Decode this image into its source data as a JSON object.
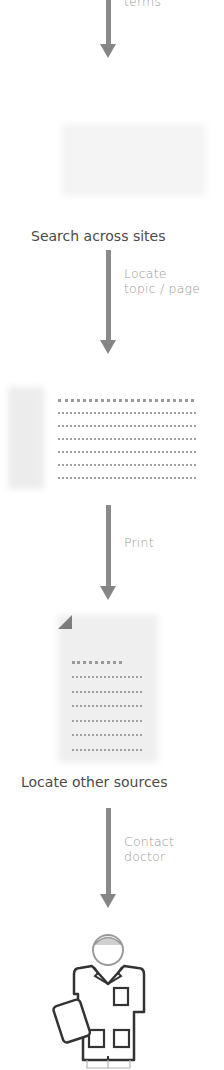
{
  "diagram": {
    "type": "vertical-flow",
    "steps": [
      {
        "edge_label_partial": "terms"
      },
      {
        "node_label": "Search across sites",
        "icon": "faded-webpage-icon"
      },
      {
        "edge_label_line1": "Locate",
        "edge_label_line2": "topic / page"
      },
      {
        "node_icon": "search-results-document-icon"
      },
      {
        "edge_label": "Print"
      },
      {
        "node_icon": "printed-page-icon",
        "node_label": "Locate other sources"
      },
      {
        "edge_label_line1": "Contact",
        "edge_label_line2": "doctor"
      },
      {
        "node_icon": "doctor-icon"
      }
    ]
  },
  "colors": {
    "arrow": "#8a8a8a",
    "edge_label": "#9a9a9a",
    "node_label": "#4a4a4a"
  }
}
